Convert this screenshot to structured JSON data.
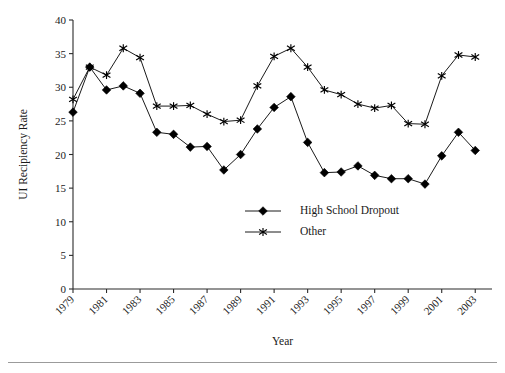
{
  "chart_data": {
    "type": "line",
    "title": "",
    "xlabel": "Year",
    "ylabel": "UI Recipiency Rate",
    "xlim": [
      1979,
      2004
    ],
    "ylim": [
      0,
      40
    ],
    "ytick_step": 5,
    "yticks": [
      0,
      5,
      10,
      15,
      20,
      25,
      30,
      35,
      40
    ],
    "xticks": [
      1979,
      1981,
      1983,
      1985,
      1987,
      1989,
      1991,
      1993,
      1995,
      1997,
      1999,
      2001,
      2003
    ],
    "xtick_labels": [
      "1979",
      "1981",
      "1983",
      "1985",
      "1987",
      "1989",
      "1991",
      "1993",
      "1995",
      "1997",
      "1999",
      "2001",
      "2003"
    ],
    "x": [
      1979,
      1980,
      1981,
      1982,
      1983,
      1984,
      1985,
      1986,
      1987,
      1988,
      1989,
      1990,
      1991,
      1992,
      1993,
      1994,
      1995,
      1996,
      1997,
      1998,
      1999,
      2000,
      2001,
      2002,
      2003
    ],
    "grid": false,
    "legend_position": "center",
    "series": [
      {
        "name": "High School Dropout",
        "marker": "diamond",
        "color": "#000000",
        "values": [
          26.3,
          33.0,
          29.6,
          30.2,
          29.1,
          23.3,
          23.0,
          21.1,
          21.2,
          17.7,
          20.0,
          23.8,
          27.0,
          28.6,
          21.8,
          17.3,
          17.4,
          18.3,
          16.9,
          16.4,
          16.4,
          15.6,
          19.8,
          23.3,
          20.6
        ]
      },
      {
        "name": "Other",
        "marker": "star",
        "color": "#000000",
        "values": [
          28.2,
          33.0,
          31.8,
          35.8,
          34.4,
          27.2,
          27.2,
          27.3,
          26.0,
          24.9,
          25.1,
          30.2,
          34.6,
          35.8,
          33.0,
          29.6,
          28.9,
          27.5,
          26.9,
          27.3,
          24.6,
          24.5,
          31.7,
          34.8,
          34.5
        ]
      }
    ],
    "legend": [
      {
        "label": "High School Dropout",
        "marker": "diamond"
      },
      {
        "label": "Other",
        "marker": "star"
      }
    ]
  }
}
